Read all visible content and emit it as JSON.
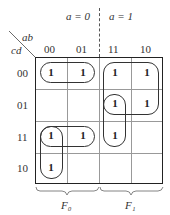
{
  "header": {
    "a0": "a = 0",
    "a1": "a = 1",
    "row_var": "cd",
    "col_var": "ab"
  },
  "columns": [
    "00",
    "01",
    "11",
    "10"
  ],
  "rows": [
    "00",
    "01",
    "11",
    "10"
  ],
  "cells": {
    "r0": [
      "1",
      "1",
      "1",
      "1"
    ],
    "r1": [
      "",
      "",
      "1",
      "1"
    ],
    "r2": [
      "1",
      "1",
      "1",
      ""
    ],
    "r3": [
      "1",
      "",
      "",
      ""
    ]
  },
  "braces": {
    "left": "F₀",
    "right": "F₁"
  }
}
